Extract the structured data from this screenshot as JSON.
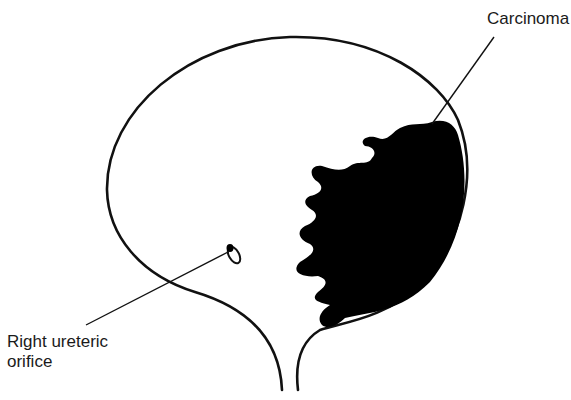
{
  "figure": {
    "labels": {
      "carcinoma": "Carcinoma",
      "orifice_line1": "Right ureteric",
      "orifice_line2": "orifice"
    },
    "colors": {
      "ink": "#111111",
      "background": "#ffffff",
      "tumor_fill": "#000000"
    }
  }
}
